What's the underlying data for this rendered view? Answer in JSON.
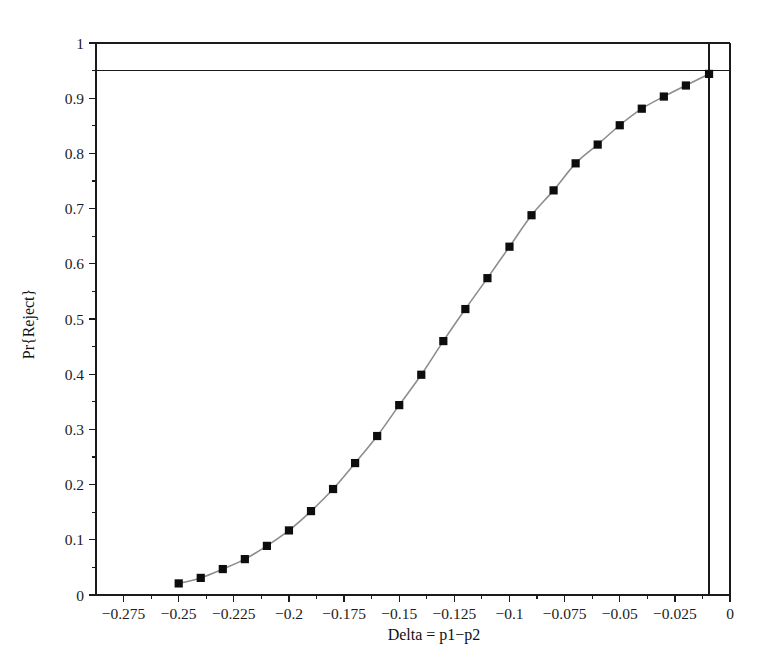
{
  "chart_data": {
    "type": "line",
    "title": "",
    "subtitle": "",
    "xlabel": "Delta = p1−p2",
    "ylabel": "Pr{Reject}",
    "xlim": [
      -0.2875,
      0.0
    ],
    "ylim": [
      0.0,
      1.0
    ],
    "grid": false,
    "legend": null,
    "legend_position": "none",
    "x_ticks": [
      -0.275,
      -0.25,
      -0.225,
      -0.2,
      -0.175,
      -0.15,
      -0.125,
      -0.1,
      -0.075,
      -0.05,
      -0.025,
      0
    ],
    "x_tick_labels": [
      "−0.275",
      "−0.25",
      "−0.225",
      "−0.2",
      "−0.175",
      "−0.15",
      "−0.125",
      "−0.1",
      "−0.075",
      "−0.05",
      "−0.025",
      "0"
    ],
    "x_minor_tick_step": 0.0125,
    "y_ticks": [
      0,
      0.1,
      0.2,
      0.3,
      0.4,
      0.5,
      0.6,
      0.7,
      0.8,
      0.9,
      1
    ],
    "y_tick_labels": [
      "0",
      "0.1",
      "0.2",
      "0.3",
      "0.4",
      "0.5",
      "0.6",
      "0.7",
      "0.8",
      "0.9",
      "1"
    ],
    "reference_lines": [
      {
        "name": "power-target",
        "orientation": "horizontal",
        "value": 0.95,
        "label": ""
      },
      {
        "name": "delta-solution",
        "orientation": "vertical",
        "value": -0.0095,
        "label": ""
      }
    ],
    "series": [
      {
        "name": "power-curve",
        "marker": "filled-square",
        "marker_color": "#0d0d0d",
        "line_color": "#8d8d8d",
        "x": [
          -0.25,
          -0.24,
          -0.23,
          -0.22,
          -0.21,
          -0.2,
          -0.19,
          -0.18,
          -0.17,
          -0.16,
          -0.15,
          -0.14,
          -0.13,
          -0.12,
          -0.11,
          -0.1,
          -0.09,
          -0.08,
          -0.07,
          -0.06,
          -0.05,
          -0.04,
          -0.03,
          -0.02,
          -0.0095
        ],
        "y": [
          0.021,
          0.031,
          0.047,
          0.065,
          0.089,
          0.117,
          0.152,
          0.192,
          0.239,
          0.288,
          0.344,
          0.399,
          0.46,
          0.518,
          0.631,
          0.631,
          0.688,
          0.733,
          0.782,
          0.816,
          0.851,
          0.881,
          0.903,
          0.923,
          0.944
        ]
      }
    ],
    "data_points": [
      {
        "x": -0.25,
        "y": 0.021
      },
      {
        "x": -0.24,
        "y": 0.031
      },
      {
        "x": -0.23,
        "y": 0.047
      },
      {
        "x": -0.22,
        "y": 0.065
      },
      {
        "x": -0.21,
        "y": 0.089
      },
      {
        "x": -0.2,
        "y": 0.117
      },
      {
        "x": -0.19,
        "y": 0.152
      },
      {
        "x": -0.18,
        "y": 0.192
      },
      {
        "x": -0.17,
        "y": 0.239
      },
      {
        "x": -0.16,
        "y": 0.288
      },
      {
        "x": -0.15,
        "y": 0.344
      },
      {
        "x": -0.14,
        "y": 0.399
      },
      {
        "x": -0.13,
        "y": 0.46
      },
      {
        "x": -0.12,
        "y": 0.518
      },
      {
        "x": -0.11,
        "y": 0.574
      },
      {
        "x": -0.1,
        "y": 0.631
      },
      {
        "x": -0.09,
        "y": 0.688
      },
      {
        "x": -0.08,
        "y": 0.733
      },
      {
        "x": -0.07,
        "y": 0.782
      },
      {
        "x": -0.06,
        "y": 0.816
      },
      {
        "x": -0.05,
        "y": 0.851
      },
      {
        "x": -0.04,
        "y": 0.881
      },
      {
        "x": -0.03,
        "y": 0.903
      },
      {
        "x": -0.02,
        "y": 0.923
      },
      {
        "x": -0.0095,
        "y": 0.944
      }
    ]
  },
  "colors": {
    "axis": "#1b1b1b",
    "marker": "#0d0d0d",
    "curve": "#8d8d8d",
    "background": "#ffffff",
    "text": "#1c1c1c"
  }
}
